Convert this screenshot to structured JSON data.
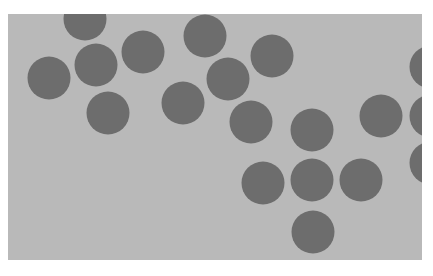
{
  "image": {
    "description": "Grey rectangle with scattered dark grey circles",
    "panel": {
      "x": 8,
      "y": 14,
      "width": 414,
      "height": 246
    },
    "colors": {
      "background": "#ffffff",
      "panel": "#b9b9b9",
      "circle": "#6d6d6d"
    },
    "circle_radius": 21.5,
    "circles": [
      {
        "cx": 85,
        "cy": 19
      },
      {
        "cx": 49,
        "cy": 78
      },
      {
        "cx": 96,
        "cy": 65
      },
      {
        "cx": 143,
        "cy": 52
      },
      {
        "cx": 108,
        "cy": 113
      },
      {
        "cx": 205,
        "cy": 36
      },
      {
        "cx": 228,
        "cy": 79
      },
      {
        "cx": 272,
        "cy": 56
      },
      {
        "cx": 183,
        "cy": 103
      },
      {
        "cx": 251,
        "cy": 122
      },
      {
        "cx": 312,
        "cy": 130
      },
      {
        "cx": 381,
        "cy": 116
      },
      {
        "cx": 263,
        "cy": 183
      },
      {
        "cx": 312,
        "cy": 180
      },
      {
        "cx": 361,
        "cy": 180
      },
      {
        "cx": 313,
        "cy": 232
      },
      {
        "cx": 431,
        "cy": 67
      },
      {
        "cx": 431,
        "cy": 116
      },
      {
        "cx": 431,
        "cy": 163
      }
    ]
  }
}
